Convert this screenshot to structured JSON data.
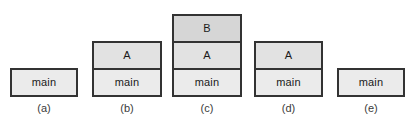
{
  "figure": {
    "type": "stack-frame-diagram",
    "background_color": "#ffffff",
    "width": 410,
    "height": 129,
    "border_color": "#333333",
    "text_color": "#1a1a1a",
    "label_color": "#3a3a3a"
  },
  "frame_styles": {
    "main": {
      "fill": "#ebebeb"
    },
    "A": {
      "fill": "#e2e2e2"
    },
    "B": {
      "fill": "#d6d6d6"
    }
  },
  "columns": [
    {
      "label": "(a)",
      "x": 10,
      "width": 68,
      "frames": [
        {
          "text": "main",
          "style": "main"
        }
      ]
    },
    {
      "label": "(b)",
      "x": 92,
      "width": 70,
      "frames": [
        {
          "text": "A",
          "style": "A"
        },
        {
          "text": "main",
          "style": "main"
        }
      ]
    },
    {
      "label": "(c)",
      "x": 172,
      "width": 70,
      "frames": [
        {
          "text": "B",
          "style": "B"
        },
        {
          "text": "A",
          "style": "A"
        },
        {
          "text": "main",
          "style": "main"
        }
      ]
    },
    {
      "label": "(d)",
      "x": 254,
      "width": 69,
      "frames": [
        {
          "text": "A",
          "style": "A"
        },
        {
          "text": "main",
          "style": "main"
        }
      ]
    },
    {
      "label": "(e)",
      "x": 337,
      "width": 68,
      "frames": [
        {
          "text": "main",
          "style": "main"
        }
      ]
    }
  ]
}
